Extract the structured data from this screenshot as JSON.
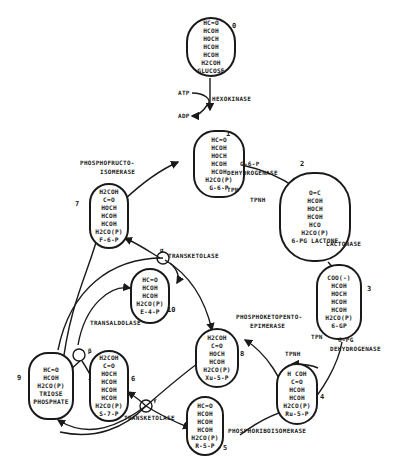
{
  "diagram": {
    "nodes": [
      {
        "id": "0",
        "number": "0",
        "name": "glucose",
        "lines": [
          "HC=O",
          "HCOH",
          "HOCH",
          "HCOH",
          "HCOH",
          "H2COH",
          "GLUCOSE"
        ]
      },
      {
        "id": "1",
        "number": "1",
        "name": "glucose-6-phosphate",
        "lines": [
          "HC=O",
          "HCOH",
          "HOCH",
          "HCOH",
          "HCOH",
          "H2CO(P)",
          "G-6-P"
        ]
      },
      {
        "id": "2",
        "number": "2",
        "name": "6-phosphogluconolactone",
        "lines": [
          "O=C",
          "HCOH",
          "HOCH",
          "HCOH",
          "HCO",
          "H2CO(P)",
          "6-PG LACTONE"
        ]
      },
      {
        "id": "3",
        "number": "3",
        "name": "6-phosphogluconate",
        "lines": [
          "COO(-)",
          "HCOH",
          "HOCH",
          "HCOH",
          "HCOH",
          "H2CO(P)",
          "6-GP"
        ]
      },
      {
        "id": "4",
        "number": "4",
        "name": "ribulose-5-phosphate",
        "lines": [
          "H COH",
          "C=O",
          "HCOH",
          "HCOH",
          "H2CO(P)",
          "Ru-5-P"
        ]
      },
      {
        "id": "5",
        "number": "5",
        "name": "ribose-5-phosphate",
        "lines": [
          "HC=O",
          "HCOH",
          "HCOH",
          "HCOH",
          "H2CO(P)",
          "R-5-P"
        ]
      },
      {
        "id": "6",
        "number": "6",
        "name": "sedoheptulose-7-phosphate",
        "lines": [
          "H2COH",
          "C=O",
          "HOCH",
          "HCOH",
          "HCOH",
          "HCOH",
          "H2CO(P)",
          "S-7-P"
        ]
      },
      {
        "id": "7",
        "number": "7",
        "name": "fructose-6-phosphate",
        "lines": [
          "H2COH",
          "C=O",
          "HOCH",
          "HCOH",
          "HCOH",
          "H2CO(P)",
          "F-6-P"
        ]
      },
      {
        "id": "8",
        "number": "8",
        "name": "xylulose-5-phosphate",
        "lines": [
          "H2COH",
          "C=O",
          "HOCH",
          "HCOH",
          "H2CO(P)",
          "Xu-5-P"
        ]
      },
      {
        "id": "9",
        "number": "9",
        "name": "triose-phosphate",
        "lines": [
          "HC=O",
          "HCOH",
          "H2CO(P)",
          "TRIOSE",
          "PHOSPHATE"
        ]
      },
      {
        "id": "10",
        "number": "10",
        "name": "erythrose-4-phosphate",
        "lines": [
          "HC=O",
          "HCOH",
          "HCOH",
          "H2CO(P)",
          "E-4-P"
        ]
      }
    ],
    "enzymes": {
      "hexokinase": "HEXOKINASE",
      "g6p_dh_1": "G-6-P",
      "g6p_dh_2": "DEHYDROGENASE",
      "lactonase": "LACTONASE",
      "pg_dh_1": "6-PG",
      "pg_dh_2": "DEHYDROGENASE",
      "epimerase_1": "PHOSPHOKETOPENTO-",
      "epimerase_2": "EPIMERASE",
      "isomerase_ribose": "PHOSPHORIBOISOMERASE",
      "isomerase_fructo_1": "PHOSPHOFRUCTO-",
      "isomerase_fructo_2": "ISOMERASE",
      "transketolase_alpha": "TRANSKETOLASE",
      "transketolase_gamma": "TRANSKETOLASE",
      "transaldolase": "TRANSALDOLASE"
    },
    "cofactors": {
      "atp": "ATP",
      "adp": "ADP",
      "tpn_1": "TPN",
      "tpnh_1": "TPNH",
      "tpn_2": "TPN",
      "tpnh_2": "TPNH"
    },
    "greek": {
      "alpha": "α",
      "beta": "β",
      "gamma": "γ"
    }
  }
}
